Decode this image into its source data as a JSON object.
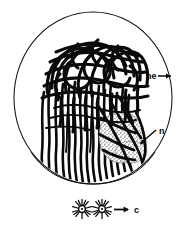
{
  "figure": {
    "background_color": "#ffffff",
    "ink_color": "#0a0a0a",
    "width": 190,
    "height": 226
  },
  "structures": {
    "nuclear_envelope": {
      "name": "nuclear envelope",
      "shape": "thin circle outline",
      "center_x": 93,
      "center_y": 98,
      "radius_x": 79,
      "radius_y": 86,
      "stroke_width": 1.0
    },
    "chromatin": {
      "name": "chromatin threads",
      "description": "dense tangled looping threads above, parallel wavy vertical fibers below",
      "stroke_width_thick": 3.1,
      "stroke_width_thin": 2.0
    },
    "nucleolus": {
      "name": "nucleolus",
      "shape": "stippled oval blob",
      "center_x": 120,
      "center_y": 137,
      "radius_x": 22,
      "radius_y": 22,
      "stipple_color": "#4a4a4a"
    },
    "centrioles": {
      "name": "centriole asters",
      "count": 2,
      "aster_1_x": 82,
      "aster_1_y": 209,
      "aster_2_x": 102,
      "aster_2_y": 209,
      "ray_count": 14
    }
  },
  "labels": [
    {
      "id": "ne",
      "text": "ne",
      "refers_to": "nuclear envelope",
      "x": 146,
      "y": 79,
      "arrow": {
        "from_x": 158,
        "from_y": 76,
        "to_x": 173,
        "to_y": 76,
        "direction": "right"
      }
    },
    {
      "id": "n",
      "text": "n",
      "refers_to": "nucleolus",
      "x": 159,
      "y": 134,
      "arrow": {
        "from_x": 157,
        "from_y": 130,
        "to_x": 138,
        "to_y": 145,
        "direction": "down-left"
      }
    },
    {
      "id": "c",
      "text": "c",
      "refers_to": "centrioles",
      "x": 136,
      "y": 213,
      "arrow": {
        "from_x": 115,
        "from_y": 210,
        "to_x": 130,
        "to_y": 210,
        "direction": "right"
      }
    }
  ]
}
